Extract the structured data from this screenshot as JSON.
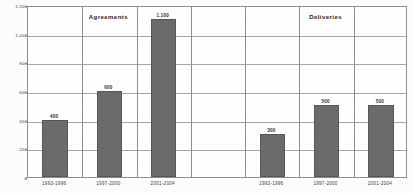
{
  "chart_data": {
    "type": "bar",
    "title": "",
    "xlabel": "",
    "ylabel": "",
    "ylim": [
      0,
      1200
    ],
    "grid": true,
    "legend_position": "none",
    "panels": [
      {
        "name": "agreements-panel",
        "title": "Agreements",
        "categories": [
          "1993-1996",
          "1997-2000",
          "2001-2004"
        ],
        "values": [
          400,
          600,
          1100
        ],
        "value_labels": [
          "400",
          "600",
          "1,100"
        ]
      },
      {
        "name": "deliveries-panel",
        "title": "Deliveries",
        "categories": [
          "1993-1996",
          "1997-2000",
          "2001-2004"
        ],
        "values": [
          300,
          500,
          500
        ],
        "value_labels": [
          "300",
          "500",
          "500"
        ]
      }
    ],
    "y_ticks": [
      0,
      200,
      400,
      600,
      800,
      1000,
      1200
    ],
    "y_tick_labels": [
      "0",
      "200",
      "400",
      "600",
      "800",
      "1,000",
      "1,200"
    ],
    "bar_color": "#6b6b6b",
    "grid_color": "#a6a6a6",
    "frame_color": "#8d8d8d"
  }
}
